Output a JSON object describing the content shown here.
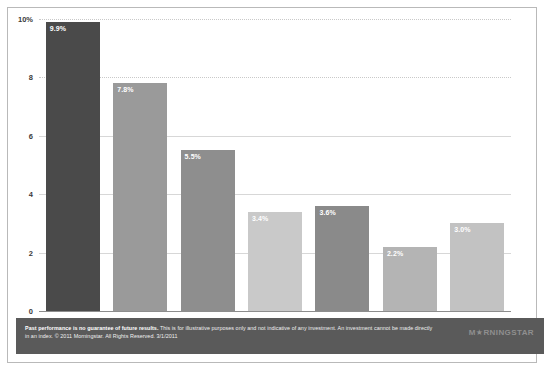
{
  "chart_data": {
    "type": "bar",
    "title": "",
    "subtitle": "",
    "xlabel": "",
    "ylabel": "",
    "ylim": [
      0,
      10
    ],
    "grid": true,
    "legend": "none",
    "categories": [
      "Stocks",
      "Stocks after\ntaxes",
      "Bonds",
      "Bonds after\ntaxes",
      "Cash",
      "Cash after\ntaxes",
      "Inflation"
    ],
    "values": [
      9.9,
      7.8,
      5.5,
      3.4,
      3.6,
      2.2,
      3.0
    ],
    "data_labels": [
      "9.9%",
      "7.8%",
      "5.5%",
      "3.4%",
      "3.6%",
      "2.2%",
      "3.0%"
    ],
    "bar_colors": [
      "#4a4a4a",
      "#9a9a9a",
      "#8e8e8e",
      "#c9c9c9",
      "#8a8a8a",
      "#b4b4b4",
      "#c2c2c2"
    ],
    "ytick_labels": [
      "10%",
      "8",
      "6",
      "4",
      "2",
      "0"
    ],
    "ytick_values": [
      10,
      8,
      6,
      4,
      2,
      0
    ]
  },
  "footer": {
    "bold_lead": "Past performance is no guarantee of future results.",
    "body": " This is for illustrative purposes only and not indicative of any investment. An investment cannot be made directly in an index. © 2011 Morningstar. All Rights Reserved. 3/1/2011",
    "logo": "M★RNINGSTAR"
  },
  "colors": {
    "panel_bg": "#ffffff",
    "grid": "#d7d7d7",
    "axis": "#8d8d8d",
    "footer_bg": "#5a5a5a",
    "text": "#2f2f2f"
  }
}
